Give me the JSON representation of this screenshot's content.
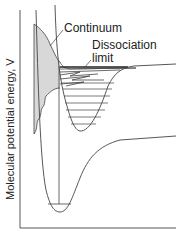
{
  "diagram": {
    "type": "potential-energy-curves",
    "y_axis_label": "Molecular potential energy, V",
    "labels": {
      "continuum": "Continuum",
      "dissociation_line1": "Dissociation",
      "dissociation_line2": "limit"
    },
    "colors": {
      "line": "#444444",
      "shading": "#d8d8d8",
      "background": "#ffffff"
    }
  }
}
